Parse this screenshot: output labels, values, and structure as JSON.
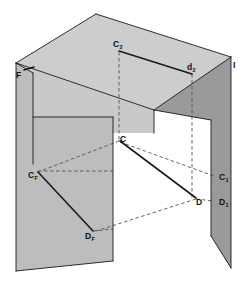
{
  "figure": {
    "type": "descriptive-geometry-diagram",
    "background_color": "#ffffff",
    "colors": {
      "plane_top_fill": "#cdcdcd",
      "plane_left_fill": "#c6c6c6",
      "plane_right_fill": "#a8a8a8",
      "plane_right_edge_fill": "#9a9a9a",
      "plane_left_edge_fill": "#bdbdbd",
      "line_solid": "#1a1a1a",
      "line_dashed": "#555555",
      "label_text": "#111111"
    }
  },
  "labels": [
    {
      "id": "plane-f",
      "main": "F",
      "sub": "",
      "x": 16,
      "y": 78,
      "anchor": "start",
      "note": "frontal plane designator with tick mark"
    },
    {
      "id": "c2",
      "main": "C",
      "sub": "2",
      "x": 113,
      "y": 47,
      "anchor": "start",
      "note": "projection of C on top plane"
    },
    {
      "id": "d2",
      "main": "d",
      "sub": "2",
      "x": 187,
      "y": 70,
      "anchor": "start",
      "note": "projection of D on top plane"
    },
    {
      "id": "plane-i",
      "main": "I",
      "sub": "",
      "x": 233,
      "y": 68,
      "anchor": "start",
      "note": "profile plane designator"
    },
    {
      "id": "c",
      "main": "C",
      "sub": "",
      "x": 120,
      "y": 142,
      "anchor": "start",
      "note": "point C in space"
    },
    {
      "id": "cf",
      "main": "C",
      "sub": "F",
      "x": 28,
      "y": 178,
      "anchor": "start",
      "note": "projection of C on frontal plane"
    },
    {
      "id": "c1",
      "main": "C",
      "sub": "1",
      "x": 219,
      "y": 180,
      "anchor": "start",
      "note": "projection of C on profile plane"
    },
    {
      "id": "d",
      "main": "D",
      "sub": "",
      "x": 196,
      "y": 205,
      "anchor": "start",
      "note": "point D in space"
    },
    {
      "id": "d1",
      "main": "D",
      "sub": "1",
      "x": 219,
      "y": 205,
      "anchor": "start",
      "note": "projection of D on profile plane"
    },
    {
      "id": "df",
      "main": "D",
      "sub": "F",
      "x": 85,
      "y": 239,
      "anchor": "start",
      "note": "projection of D on frontal plane"
    }
  ],
  "geometry": {
    "planes": [
      {
        "name": "top-horizontal-plane",
        "fill": "#cdcdcd",
        "points": "16,63 96,14 231,57 154,110"
      },
      {
        "name": "top-plane-inner-face",
        "fill": "#c9c9c9",
        "points": "16,63 154,110 154,133 113,133 113,117 33,117 33,73"
      },
      {
        "name": "left-frontal-plane",
        "fill": "#c6c6c6",
        "points": "16,63 16,271 113,261 113,117 33,117 33,73"
      },
      {
        "name": "left-plane-edge-strip",
        "fill": "#bdbdbd",
        "points": "16,63 33,73 33,117 113,117 113,261 16,271"
      },
      {
        "name": "right-profile-plane",
        "fill": "#a8a8a8",
        "points": "231,57 231,268 211,236 211,120 154,110"
      },
      {
        "name": "right-plane-inner-strip",
        "fill": "#9a9a9a",
        "points": "154,110 211,120 211,236 231,268 231,57"
      }
    ],
    "solid_lines": [
      {
        "name": "top-plane-edge-back-left",
        "x1": 16,
        "y1": 63,
        "x2": 96,
        "y2": 14
      },
      {
        "name": "top-plane-edge-back-right",
        "x1": 96,
        "y1": 14,
        "x2": 231,
        "y2": 57
      },
      {
        "name": "top-plane-edge-front-right",
        "x1": 231,
        "y1": 57,
        "x2": 154,
        "y2": 110
      },
      {
        "name": "top-plane-edge-front-left",
        "x1": 154,
        "y1": 110,
        "x2": 16,
        "y2": 63
      },
      {
        "name": "segment-C2-d2",
        "x1": 119,
        "y1": 51,
        "x2": 192,
        "y2": 74
      },
      {
        "name": "left-plane-top-edge",
        "x1": 16,
        "y1": 63,
        "x2": 33,
        "y2": 73
      },
      {
        "name": "left-plane-vert-outer",
        "x1": 16,
        "y1": 63,
        "x2": 16,
        "y2": 271
      },
      {
        "name": "left-plane-vert-inner",
        "x1": 33,
        "y1": 73,
        "x2": 33,
        "y2": 164
      },
      {
        "name": "left-plane-bottom-edge",
        "x1": 16,
        "y1": 271,
        "x2": 113,
        "y2": 261
      },
      {
        "name": "inner-corner-vert",
        "x1": 113,
        "y1": 117,
        "x2": 113,
        "y2": 261
      },
      {
        "name": "inner-corner-horiz",
        "x1": 33,
        "y1": 117,
        "x2": 113,
        "y2": 117
      },
      {
        "name": "segment-CF-DF",
        "x1": 38,
        "y1": 172,
        "x2": 93,
        "y2": 231
      },
      {
        "name": "segment-C-D",
        "x1": 120,
        "y1": 141,
        "x2": 196,
        "y2": 198
      },
      {
        "name": "right-plane-outer-vert",
        "x1": 231,
        "y1": 57,
        "x2": 231,
        "y2": 268
      },
      {
        "name": "right-plane-inner-vert",
        "x1": 211,
        "y1": 120,
        "x2": 211,
        "y2": 236
      },
      {
        "name": "right-plane-top-edge",
        "x1": 154,
        "y1": 110,
        "x2": 211,
        "y2": 120
      },
      {
        "name": "right-plane-bottom-edge",
        "x1": 211,
        "y1": 236,
        "x2": 231,
        "y2": 268
      },
      {
        "name": "center-vert-edge",
        "x1": 154,
        "y1": 110,
        "x2": 154,
        "y2": 133
      },
      {
        "name": "plane-f-tick",
        "x1": 24,
        "y1": 70,
        "x2": 34,
        "y2": 67
      }
    ],
    "dashed_lines": [
      {
        "name": "C2-to-C-projector",
        "x1": 119,
        "y1": 52,
        "x2": 119,
        "y2": 140
      },
      {
        "name": "d2-to-D-projector",
        "x1": 192,
        "y1": 74,
        "x2": 192,
        "y2": 198
      },
      {
        "name": "C-to-CF-projector",
        "x1": 119,
        "y1": 141,
        "x2": 38,
        "y2": 172
      },
      {
        "name": "C-to-C1-projector",
        "x1": 120,
        "y1": 142,
        "x2": 214,
        "y2": 176
      },
      {
        "name": "D-to-DF-projector",
        "x1": 196,
        "y1": 199,
        "x2": 93,
        "y2": 232
      },
      {
        "name": "D-to-D1-projector",
        "x1": 196,
        "y1": 199,
        "x2": 214,
        "y2": 201
      },
      {
        "name": "CF-horizontal-guide",
        "x1": 38,
        "y1": 171,
        "x2": 113,
        "y2": 171
      },
      {
        "name": "DF-horizontal-guide",
        "x1": 93,
        "y1": 231,
        "x2": 113,
        "y2": 229
      }
    ]
  }
}
